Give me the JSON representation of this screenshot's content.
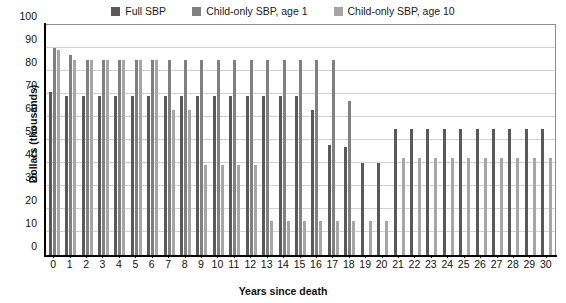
{
  "chart_data": {
    "type": "bar",
    "title": "",
    "xlabel": "Years since death",
    "ylabel": "Dollars (thousands)",
    "ylim": [
      0,
      100
    ],
    "ytick_step": 10,
    "yticks": [
      0,
      10,
      20,
      30,
      40,
      50,
      60,
      70,
      80,
      90,
      100
    ],
    "grid": true,
    "legend_position": "top-center",
    "categories": [
      "0",
      "1",
      "2",
      "3",
      "4",
      "5",
      "6",
      "7",
      "8",
      "9",
      "10",
      "11",
      "12",
      "13",
      "14",
      "15",
      "16",
      "17",
      "18",
      "19",
      "20",
      "21",
      "22",
      "23",
      "24",
      "25",
      "26",
      "27",
      "28",
      "29",
      "30"
    ],
    "series": [
      {
        "name": "Full SBP",
        "color": "#595959",
        "values": [
          71,
          69,
          69,
          69,
          69,
          69,
          69,
          69,
          69,
          69,
          69,
          69,
          69,
          69,
          69,
          69,
          63,
          48,
          47,
          40,
          40,
          55,
          55,
          55,
          55,
          55,
          55,
          55,
          55,
          55,
          55
        ]
      },
      {
        "name": "Child-only SBP, age 1",
        "color": "#808080",
        "values": [
          90,
          87,
          85,
          85,
          85,
          85,
          85,
          85,
          85,
          85,
          85,
          85,
          85,
          85,
          85,
          85,
          85,
          85,
          67,
          0,
          0,
          0,
          0,
          0,
          0,
          0,
          0,
          0,
          0,
          0,
          0
        ]
      },
      {
        "name": "Child-only SBP, age 10",
        "color": "#a6a6a6",
        "values": [
          89,
          85,
          85,
          85,
          85,
          85,
          85,
          63,
          63,
          39,
          39,
          39,
          39,
          15,
          15,
          15,
          15,
          15,
          15,
          15,
          15,
          42,
          42,
          42,
          42,
          42,
          42,
          42,
          42,
          42,
          42
        ]
      }
    ]
  },
  "legend": {
    "items": [
      {
        "label": "Full SBP",
        "swatch": "#595959",
        "icon": "legend-swatch-icon"
      },
      {
        "label": "Child-only SBP, age 1",
        "swatch": "#808080",
        "icon": "legend-swatch-icon"
      },
      {
        "label": "Child-only SBP, age 10",
        "swatch": "#a6a6a6",
        "icon": "legend-swatch-icon"
      }
    ]
  },
  "axes": {
    "y_title": "Dollars (thousands)",
    "x_title": "Years since death"
  },
  "colors": {
    "background": "#ffffff",
    "gridline": "#d2d2d2",
    "axis": "#000000",
    "plot_border": "#8e8e8e",
    "text": "#111111"
  }
}
